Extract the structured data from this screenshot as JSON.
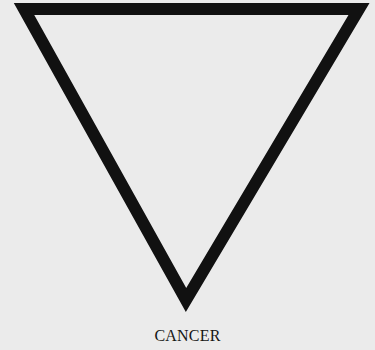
{
  "symbol": {
    "name": "inverted-triangle",
    "stroke_color": "#111111",
    "background_color": "#ebebeb"
  },
  "caption": {
    "label": "CANCER"
  }
}
